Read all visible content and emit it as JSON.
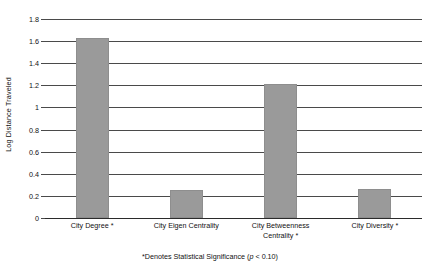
{
  "chart_data": {
    "type": "bar",
    "title": "",
    "xlabel": "",
    "ylabel": "Log Distance Traveled",
    "categories": [
      "City Degree *",
      "City Eigen Centrality",
      "City Betweenness Centrality *",
      "City Diversity *"
    ],
    "values": [
      1.63,
      0.25,
      1.21,
      0.26
    ],
    "ylim": [
      0,
      1.8
    ],
    "ytick_values": [
      0,
      0.2,
      0.4,
      0.6,
      0.8,
      1,
      1.2,
      1.4,
      1.6,
      1.8
    ],
    "ytick_labels": [
      "0",
      "0.2",
      "0.4",
      "0.6",
      "0.8",
      "1",
      "1.2",
      "1.4",
      "1.6",
      "1.8"
    ],
    "grid": true,
    "legend": "none",
    "bar_color": "#9a9a9a",
    "gridline_color": "#4a4a4a",
    "axis_color": "#2b2b2b"
  },
  "axis": {
    "y_title": "Log Distance Traveled"
  },
  "category_labels": [
    {
      "line1": "City Degree *",
      "line2": ""
    },
    {
      "line1": "City Eigen Centrality",
      "line2": ""
    },
    {
      "line1": "City Betweenness",
      "line2": "Centrality *"
    },
    {
      "line1": "City Diversity *",
      "line2": ""
    }
  ],
  "footnote": {
    "prefix": "*Denotes Statistical Significance (",
    "italic": "p",
    "suffix": " < 0.10)"
  }
}
